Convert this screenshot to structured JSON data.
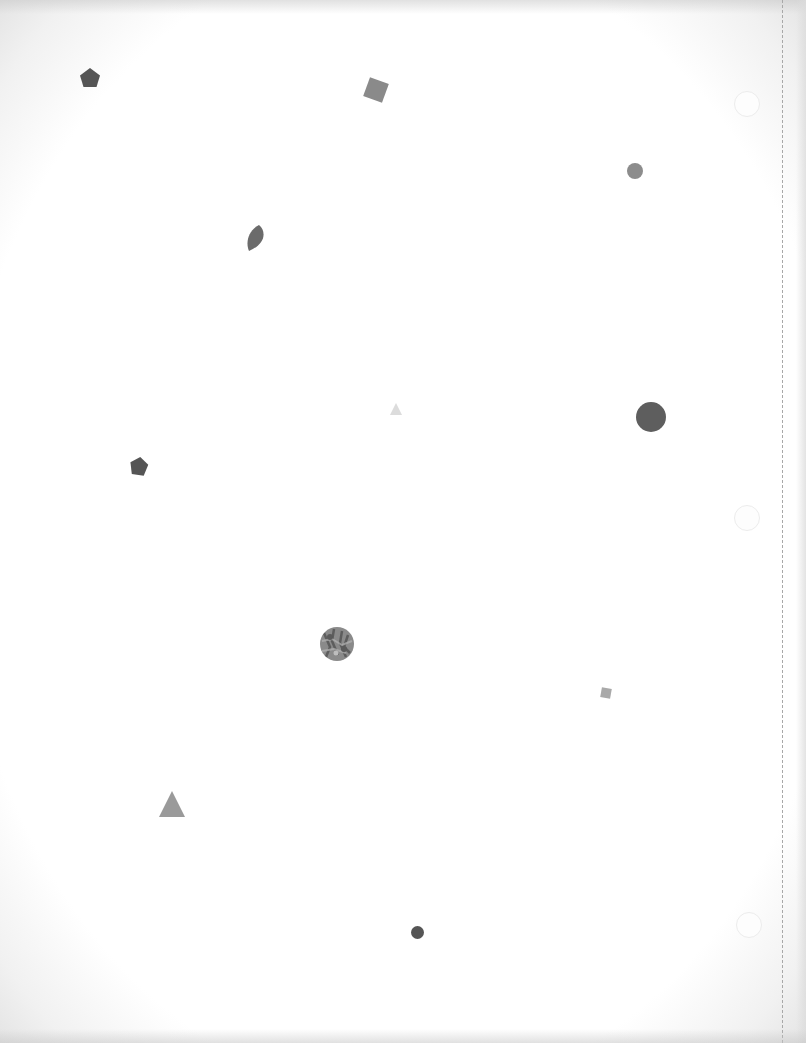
{
  "page": {
    "background": "#ffffff",
    "margin_line": "dashed",
    "punch_holes": [
      {
        "x": 747,
        "y": 104
      },
      {
        "x": 747,
        "y": 518
      },
      {
        "x": 749,
        "y": 925
      }
    ]
  },
  "shapes": [
    {
      "type": "pentagon",
      "x": 90,
      "y": 78,
      "size": 22,
      "color": "#555555"
    },
    {
      "type": "square",
      "x": 376,
      "y": 90,
      "size": 20,
      "rotation": 20,
      "color": "#8a8a8a"
    },
    {
      "type": "circle",
      "x": 635,
      "y": 171,
      "size": 16,
      "color": "#8c8c8c"
    },
    {
      "type": "leaf",
      "x": 256,
      "y": 238,
      "size": 26,
      "color": "#6b6b6b"
    },
    {
      "type": "triangle",
      "x": 396,
      "y": 410,
      "size": 14,
      "color": "#dcdcdc"
    },
    {
      "type": "circle",
      "x": 651,
      "y": 417,
      "size": 30,
      "color": "#5e5e5e"
    },
    {
      "type": "pentagon",
      "x": 139,
      "y": 466,
      "size": 20,
      "color": "#555555"
    },
    {
      "type": "textured-circle",
      "x": 337,
      "y": 644,
      "size": 34,
      "color": "#7a7a7a"
    },
    {
      "type": "square",
      "x": 606,
      "y": 693,
      "size": 10,
      "rotation": 10,
      "color": "#a9a9a9"
    },
    {
      "type": "triangle",
      "x": 172,
      "y": 805,
      "size": 28,
      "color": "#9a9a9a"
    },
    {
      "type": "circle",
      "x": 418,
      "y": 932,
      "size": 13,
      "color": "#555555"
    }
  ]
}
